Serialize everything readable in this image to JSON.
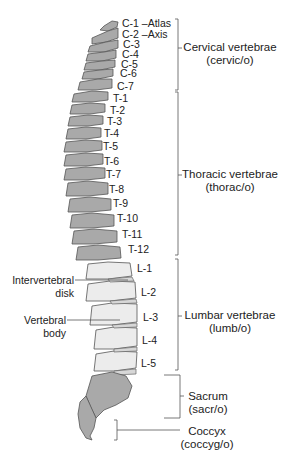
{
  "figure": {
    "colors": {
      "shaded_bone": "#a9a9a9",
      "light_bone": "#ececec",
      "outline": "#555555",
      "text": "#222222"
    },
    "vertebra_labels": {
      "c1": "C-1 –Atlas",
      "c2": "C-2 –Axis",
      "c3": "C-3",
      "c4": "C-4",
      "c5": "C-5",
      "c6": "C-6",
      "c7": "C-7",
      "t1": "T-1",
      "t2": "T-2",
      "t3": "T-3",
      "t4": "T-4",
      "t5": "T-5",
      "t6": "T-6",
      "t7": "T-7",
      "t8": "T-8",
      "t9": "T-9",
      "t10": "T-10",
      "t11": "T-11",
      "t12": "T-12",
      "l1": "L-1",
      "l2": "L-2",
      "l3": "L-3",
      "l4": "L-4",
      "l5": "L-5"
    },
    "regions": {
      "cervical": {
        "name": "Cervical vertebrae",
        "root": "(cervic/o)"
      },
      "thoracic": {
        "name": "Thoracic vertebrae",
        "root": "(thorac/o)"
      },
      "lumbar": {
        "name": "Lumbar vertebrae",
        "root": "(lumb/o)"
      },
      "sacrum": {
        "name": "Sacrum",
        "root": "(sacr/o)"
      },
      "coccyx": {
        "name": "Coccyx",
        "root": "(coccyg/o)"
      }
    },
    "side_labels": {
      "disk_line1": "Intervertebral",
      "disk_line2": "disk",
      "body_line1": "Vertebral",
      "body_line2": "body"
    }
  }
}
